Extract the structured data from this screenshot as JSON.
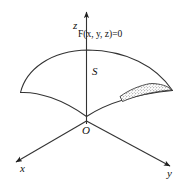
{
  "figure": {
    "background_color": "#ffffff",
    "line_color": "#333333",
    "text_color": "#111111"
  },
  "axes": {
    "z_label": "z",
    "x_label": "x",
    "y_label": "y",
    "origin_label": "O"
  },
  "surface": {
    "label": "S",
    "equation_label": "F(x, y, z)=0",
    "equation_parts": {
      "function_name": "F",
      "open_paren": "(",
      "var_x": "x",
      "comma_1": ", ",
      "var_y": "y",
      "comma_2": ", ",
      "var_z": "z",
      "close_paren": ")",
      "equals": "=",
      "value": "0"
    },
    "patch_name": "surface-element-patch",
    "patch_fill": "stipple"
  }
}
